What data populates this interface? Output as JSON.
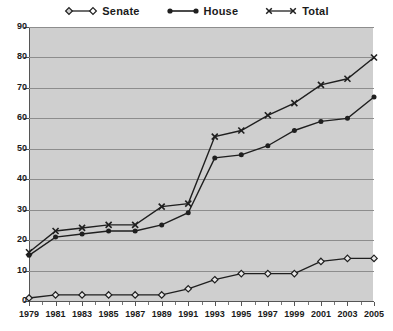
{
  "legend": {
    "position": "top-center",
    "items": [
      {
        "label": "Senate",
        "marker": "open-diamond-icon",
        "color": "#1f1f1f"
      },
      {
        "label": "House",
        "marker": "filled-circle-icon",
        "color": "#1f1f1f"
      },
      {
        "label": "Total",
        "marker": "cross-x-icon",
        "color": "#1f1f1f"
      }
    ]
  },
  "colors": {
    "plot_background": "#cfcfcf",
    "gridline": "#8d8d8d",
    "axis": "#555555",
    "series": "#1f1f1f",
    "page_background": "#ffffff"
  },
  "axes": {
    "y_ticks": [
      0,
      10,
      20,
      30,
      40,
      50,
      60,
      70,
      80,
      90
    ],
    "x_ticks": [
      1979,
      1981,
      1983,
      1985,
      1987,
      1989,
      1991,
      1993,
      1995,
      1997,
      1999,
      2001,
      2003,
      2005
    ]
  },
  "chart_data": {
    "type": "line",
    "title": "",
    "subtitle": "",
    "xlabel": "",
    "ylabel": "",
    "xlim": [
      1979,
      2005
    ],
    "ylim": [
      0,
      90
    ],
    "grid": "horizontal",
    "legend_position": "top-center",
    "x": [
      1979,
      1981,
      1983,
      1985,
      1987,
      1989,
      1991,
      1993,
      1995,
      1997,
      1999,
      2001,
      2003,
      2005
    ],
    "categories": [
      "1979",
      "1981",
      "1983",
      "1985",
      "1987",
      "1989",
      "1991",
      "1993",
      "1995",
      "1997",
      "1999",
      "2001",
      "2003",
      "2005"
    ],
    "series": [
      {
        "name": "Senate",
        "marker": "open-diamond",
        "values": [
          1,
          2,
          2,
          2,
          2,
          2,
          4,
          7,
          9,
          9,
          9,
          13,
          14,
          14
        ]
      },
      {
        "name": "House",
        "marker": "filled-circle",
        "values": [
          15,
          21,
          22,
          23,
          23,
          25,
          29,
          47,
          48,
          51,
          56,
          59,
          60,
          67
        ]
      },
      {
        "name": "Total",
        "marker": "cross-x",
        "values": [
          16,
          23,
          24,
          25,
          25,
          31,
          32,
          54,
          56,
          61,
          65,
          71,
          73,
          80
        ]
      }
    ]
  }
}
